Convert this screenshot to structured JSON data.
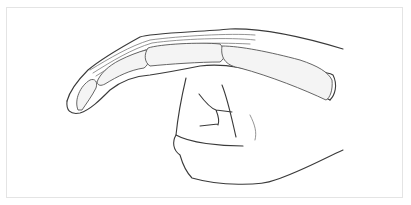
{
  "figure": {
    "style": "line-drawing",
    "colors": {
      "line": "#3a3a3a",
      "frame": "#e4e4e4",
      "background": "#ffffff"
    }
  }
}
